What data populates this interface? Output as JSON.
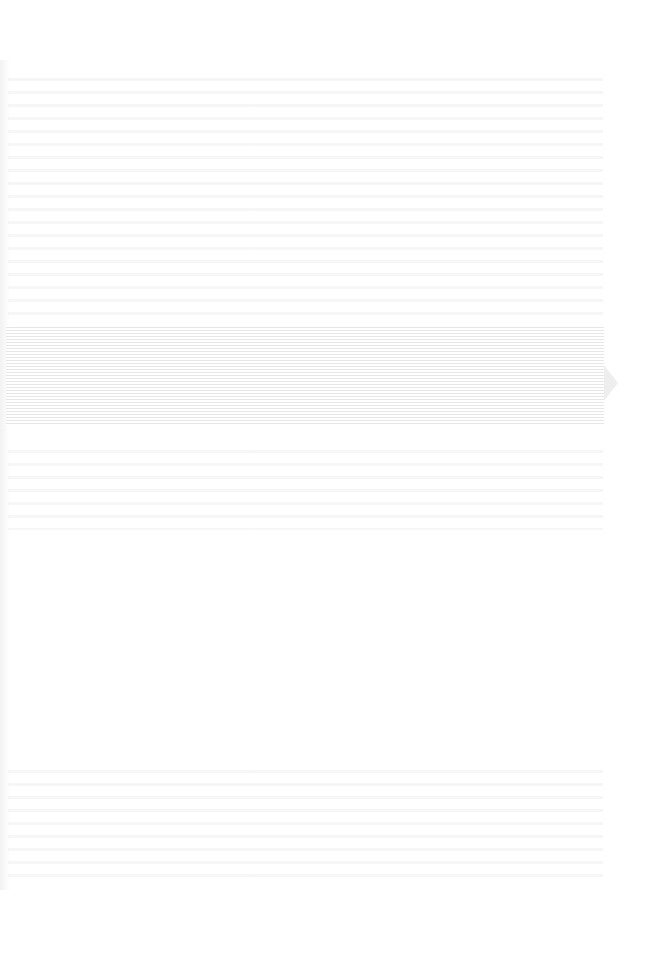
{
  "page": {
    "type": "scanned-blank-page",
    "background_color": "#ffffff",
    "bleed_color": "#e6e6e6",
    "legible_text": ""
  }
}
